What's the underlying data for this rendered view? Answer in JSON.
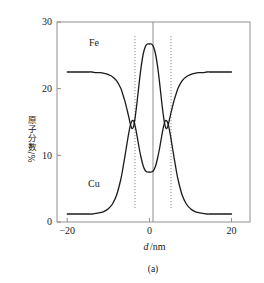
{
  "figure": {
    "caption": "(a)",
    "background_color": "#ffffff",
    "line_color": "#1a1a1a",
    "axis_color": "#808080",
    "guide_color": "#9a9a9a"
  },
  "chart_data": {
    "type": "line",
    "title": "",
    "subtitle": "",
    "xlabel": "d/nm",
    "ylabel": "x 原子分数/%",
    "ylabel_parts": {
      "symbol": "x",
      "text": "原子分数/%"
    },
    "xlabel_parts": {
      "symbol": "d",
      "unit": "/nm"
    },
    "xlim": [
      -22.5,
      24.5
    ],
    "ylim": [
      0,
      30
    ],
    "xticks": [
      -20,
      0,
      20
    ],
    "xtick_labels": [
      "−20",
      "0",
      "20"
    ],
    "yticks": [
      0,
      10,
      20,
      30
    ],
    "ytick_labels": [
      "0",
      "10",
      "20",
      "30"
    ],
    "grid": false,
    "legend_position": "inline-annotations",
    "annotations": [
      {
        "text": "Fe",
        "x": -13.5,
        "y": 26.4
      },
      {
        "text": "Cu",
        "x": -13.5,
        "y": 5.2
      }
    ],
    "guide_lines": {
      "solid_vertical_x": [
        0
      ],
      "dotted_vertical_x": [
        -4.6,
        4.6
      ]
    },
    "series": [
      {
        "name": "Fe",
        "description": "Fe atomic fraction: high plateau at edges, dips at the interfaces, central peak at d=0",
        "plateau_value": 22.5,
        "interface_crossing_value": 14.6,
        "center_peak_value": 26.7,
        "x": [
          -20,
          -19,
          -18,
          -17,
          -16,
          -15,
          -14,
          -13,
          -12,
          -11,
          -10,
          -9,
          -8,
          -7,
          -6.5,
          -6,
          -5.5,
          -5,
          -4.6,
          -4.2,
          -3.8,
          -3.4,
          -3,
          -2.5,
          -2,
          -1.5,
          -1,
          -0.5,
          0,
          0.5,
          1,
          1.5,
          2,
          2.5,
          3,
          3.4,
          3.8,
          4.2,
          4.6,
          5,
          5.5,
          6,
          6.5,
          7,
          8,
          9,
          10,
          11,
          12,
          13,
          14,
          15,
          16,
          17,
          18,
          19,
          20
        ],
        "values": [
          22.5,
          22.5,
          22.5,
          22.5,
          22.5,
          22.5,
          22.5,
          22.4,
          22.4,
          22.3,
          22.1,
          21.8,
          21.2,
          20.1,
          19.2,
          18.2,
          17.0,
          15.7,
          14.6,
          14.0,
          14.5,
          16.0,
          18.0,
          20.8,
          23.3,
          25.2,
          26.3,
          26.7,
          26.7,
          26.7,
          26.3,
          25.2,
          23.3,
          20.8,
          18.0,
          16.0,
          14.5,
          14.0,
          14.6,
          15.7,
          17.0,
          18.2,
          19.2,
          20.1,
          21.2,
          21.8,
          22.1,
          22.3,
          22.4,
          22.4,
          22.5,
          22.5,
          22.5,
          22.5,
          22.5,
          22.5,
          22.5
        ]
      },
      {
        "name": "Cu",
        "description": "Cu atomic fraction: low plateau at edges, rises at the interfaces, central valley at d=0",
        "plateau_value": 1.2,
        "interface_crossing_value": 14.6,
        "center_valley_value": 7.5,
        "x": [
          -20,
          -19,
          -18,
          -17,
          -16,
          -15,
          -14,
          -13,
          -12,
          -11,
          -10,
          -9,
          -8,
          -7,
          -6.5,
          -6,
          -5.5,
          -5,
          -4.6,
          -4.2,
          -3.8,
          -3.4,
          -3,
          -2.5,
          -2,
          -1.5,
          -1,
          -0.5,
          0,
          0.5,
          1,
          1.5,
          2,
          2.5,
          3,
          3.4,
          3.8,
          4.2,
          4.6,
          5,
          5.5,
          6,
          6.5,
          7,
          8,
          9,
          10,
          11,
          12,
          13,
          14,
          15,
          16,
          17,
          18,
          19,
          20
        ],
        "values": [
          1.2,
          1.2,
          1.2,
          1.2,
          1.2,
          1.2,
          1.2,
          1.3,
          1.4,
          1.6,
          2.0,
          2.7,
          4.0,
          6.3,
          7.9,
          9.7,
          11.6,
          13.4,
          14.6,
          15.2,
          15.1,
          14.2,
          12.9,
          11.1,
          9.6,
          8.4,
          7.7,
          7.5,
          7.5,
          7.5,
          7.7,
          8.4,
          9.6,
          11.1,
          12.9,
          14.2,
          15.1,
          15.2,
          14.6,
          13.4,
          11.6,
          9.7,
          7.9,
          6.3,
          4.0,
          2.7,
          2.0,
          1.6,
          1.4,
          1.3,
          1.2,
          1.2,
          1.2,
          1.2,
          1.2,
          1.2,
          1.2
        ]
      }
    ]
  }
}
